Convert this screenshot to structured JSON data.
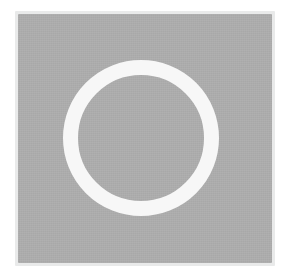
{
  "canvas": {
    "width": 288,
    "height": 277,
    "background_color": "#ffffff",
    "description": "Gray square plate with a white circular ring outline centered on it"
  },
  "plate": {
    "shape": "square",
    "fill_color": "#adadad",
    "halo_color": "#e9eaea",
    "x": 18,
    "y": 14,
    "width": 254,
    "height": 249
  },
  "ring": {
    "shape": "circle-outline",
    "stroke_color": "#f7f7f7",
    "center_x": 141,
    "center_y": 138,
    "outer_radius": 78,
    "stroke_width": 15,
    "inner_radius": 63,
    "inner_fill_color": "#adadad"
  },
  "icon": {
    "name": "circle-outline-icon",
    "label": "O"
  }
}
